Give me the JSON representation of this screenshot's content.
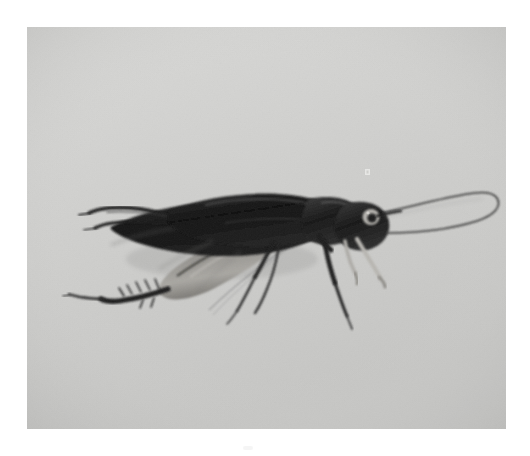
{
  "document": {
    "kind": "scanned-photograph",
    "page_background": "#ffffff",
    "caption": ""
  },
  "photo": {
    "title": "Black-and-white photograph of a cricket",
    "subject": "cricket",
    "orientation": "facing right",
    "tone": "monochrome / grayscale",
    "frame": {
      "left": 27,
      "top": 27,
      "width": 479,
      "height": 402
    },
    "colors": {
      "page": "#ffffff",
      "print_background_light": "#d6d6d4",
      "print_background": "#cfcfcd",
      "print_background_dark": "#c4c4c2",
      "body_dark": "#181818",
      "body_mid": "#3c3c3c",
      "body_shadow": "#5e5e5e",
      "limb_pale": "#b4b2ae",
      "eye_light": "#c9c7c3",
      "antenna": "#2b2b2b",
      "vignette": "#b9b9b7"
    },
    "marks": [
      {
        "name": "dust-speck",
        "x": 368,
        "y": 172,
        "tone": "light"
      },
      {
        "name": "margin-artifact",
        "x": 248,
        "y": 448,
        "tone": "very-light"
      }
    ],
    "subject_parts": [
      {
        "name": "abdomen",
        "description": "dark tapering body, left of center"
      },
      {
        "name": "forewing",
        "description": "dark glossy wing covering abdomen"
      },
      {
        "name": "pronotum",
        "description": "dark plate behind the head"
      },
      {
        "name": "head",
        "description": "rounded dark head at right"
      },
      {
        "name": "compound-eye",
        "description": "pale ring with dark pupil on head"
      },
      {
        "name": "maxillary-palps",
        "description": "two pale forward-pointing mouth appendages"
      },
      {
        "name": "antenna",
        "description": "single long thin filament arcing up and right, curving back at the tip"
      },
      {
        "name": "cerci",
        "description": "two pointed tail appendages extending left"
      },
      {
        "name": "hind-femur",
        "description": "large pale-gray jumping thigh"
      },
      {
        "name": "hind-tibia",
        "description": "spined lower leg reaching down-left"
      },
      {
        "name": "hind-tarsus",
        "description": "slender foot at far left"
      },
      {
        "name": "mid-leg",
        "description": "slim leg below the thorax"
      },
      {
        "name": "fore-leg",
        "description": "slim leg below the head reaching down-right"
      }
    ]
  }
}
